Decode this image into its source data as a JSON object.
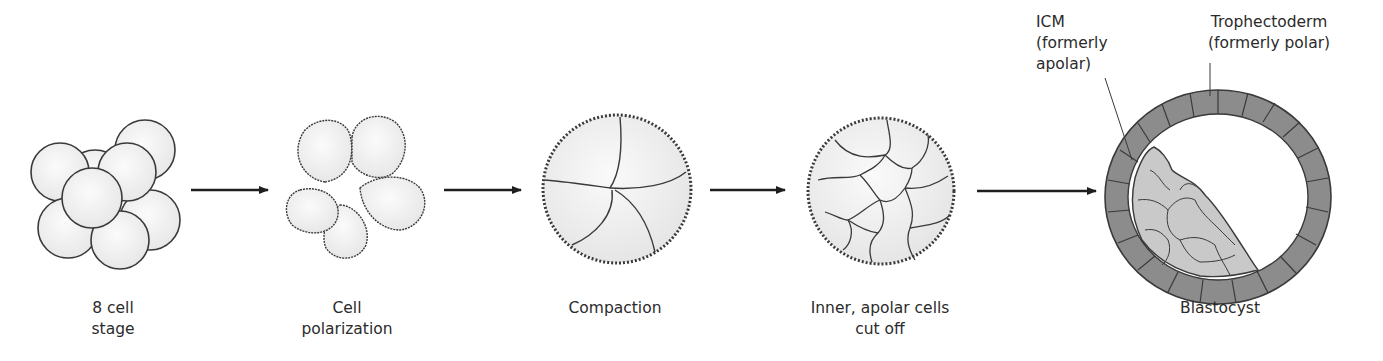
{
  "figure": {
    "type": "process-diagram",
    "stages": [
      {
        "id": "eight-cell",
        "label_lines": [
          "8 cell",
          "stage"
        ]
      },
      {
        "id": "polarization",
        "label_lines": [
          "Cell",
          "polarization"
        ]
      },
      {
        "id": "compaction",
        "label_lines": [
          "Compaction"
        ]
      },
      {
        "id": "inner-cells",
        "label_lines": [
          "Inner, apolar cells",
          "cut off"
        ]
      },
      {
        "id": "blastocyst",
        "label_lines": [
          "Blastocyst"
        ]
      }
    ],
    "annotations": {
      "icm": {
        "lines": [
          "ICM",
          "(formerly",
          "apolar)"
        ]
      },
      "trophectoderm": {
        "lines": [
          "Trophectoderm",
          "(formerly polar)"
        ]
      }
    },
    "arrows": 4,
    "colors": {
      "outline": "#3a3a3a",
      "cell_fill": "#f2f2f2",
      "trophectoderm_fill": "#8a8a8a",
      "icm_fill": "#c8c8c8",
      "arrow": "#1e1e1e"
    }
  }
}
